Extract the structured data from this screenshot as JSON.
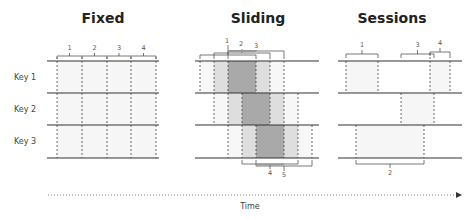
{
  "panels": {
    "fixed": {
      "title": "Fixed",
      "window_labels": [
        "1",
        "2",
        "3",
        "4"
      ]
    },
    "sliding": {
      "title": "Sliding",
      "window_labels_top": [
        "1",
        "2",
        "3"
      ],
      "window_labels_bottom": [
        "4",
        "5"
      ]
    },
    "sessions": {
      "title": "Sessions",
      "session_labels": [
        "1",
        "2",
        "3",
        "4"
      ]
    }
  },
  "keys": [
    "Key 1",
    "Key 2",
    "Key 3"
  ],
  "axis": {
    "label": "Time"
  },
  "colors": {
    "line": "#333333",
    "dashed": "#444444",
    "light_fill": "#f3f3f3",
    "mid_fill": "#d9d9d9",
    "dark_fill": "#a6a6a6",
    "bracket": "#555555"
  }
}
